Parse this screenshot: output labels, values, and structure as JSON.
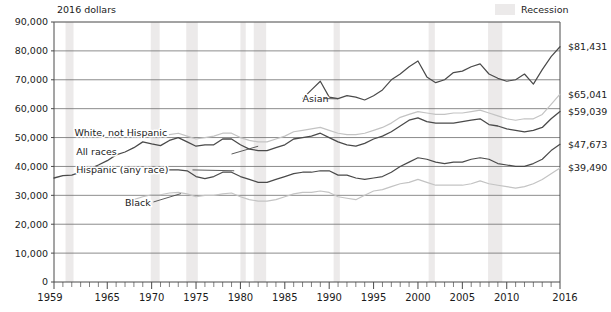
{
  "legend": {
    "recession_label": "Recession",
    "recession_color": "#eceaea"
  },
  "units_note": "2016 dollars",
  "chart_data": {
    "type": "line",
    "title": "",
    "subtitle": "",
    "xlabel": "",
    "ylabel": "2016 dollars",
    "xlim": [
      1959,
      2016
    ],
    "ylim": [
      0,
      90000
    ],
    "grid": true,
    "legend_position": "inline-labels",
    "yticks": [
      "0",
      "10,000",
      "20,000",
      "30,000",
      "40,000",
      "50,000",
      "60,000",
      "70,000",
      "80,000",
      "90,000"
    ],
    "ytick_values": [
      0,
      10000,
      20000,
      30000,
      40000,
      50000,
      60000,
      70000,
      80000,
      90000
    ],
    "xticks": [
      "1959",
      "1965",
      "1970",
      "1975",
      "1980",
      "1985",
      "1990",
      "1995",
      "2000",
      "2005",
      "2010",
      "2016"
    ],
    "xtick_values": [
      1959,
      1965,
      1970,
      1975,
      1980,
      1985,
      1990,
      1995,
      2000,
      2005,
      2010,
      2016
    ],
    "recessions": [
      {
        "start": 1960.3,
        "end": 1961.2
      },
      {
        "start": 1969.9,
        "end": 1970.9
      },
      {
        "start": 1973.9,
        "end": 1975.2
      },
      {
        "start": 1980.0,
        "end": 1980.6
      },
      {
        "start": 1981.5,
        "end": 1982.9
      },
      {
        "start": 1990.5,
        "end": 1991.2
      },
      {
        "start": 2001.2,
        "end": 2001.9
      },
      {
        "start": 2007.9,
        "end": 2009.5
      }
    ],
    "series": [
      {
        "name": "Asian",
        "color": "#4a4a4a",
        "width": 1.2,
        "end_label": "$81,431",
        "end_value": 81431,
        "label_x": 1987.0,
        "label_y": 63500,
        "x": [
          1987,
          1988,
          1989,
          1990,
          1991,
          1992,
          1993,
          1994,
          1995,
          1996,
          1997,
          1998,
          1999,
          2000,
          2001,
          2002,
          2003,
          2004,
          2005,
          2006,
          2007,
          2008,
          2009,
          2010,
          2011,
          2012,
          2013,
          2014,
          2015,
          2016
        ],
        "values": [
          63500,
          66500,
          69500,
          64000,
          63500,
          64500,
          64000,
          63000,
          64500,
          66500,
          70000,
          72000,
          74500,
          76500,
          71000,
          69000,
          70000,
          72500,
          73000,
          74500,
          75500,
          72000,
          70500,
          69500,
          70000,
          72000,
          68500,
          73500,
          78000,
          81431
        ]
      },
      {
        "name": "White, not Hispanic",
        "color": "#c3c3c3",
        "width": 1.2,
        "end_label": "$65,041",
        "end_value": 65041,
        "label_x": 1961.3,
        "label_y": 51500,
        "x": [
          1972,
          1973,
          1974,
          1975,
          1976,
          1977,
          1978,
          1979,
          1980,
          1981,
          1982,
          1983,
          1984,
          1985,
          1986,
          1987,
          1988,
          1989,
          1990,
          1991,
          1992,
          1993,
          1994,
          1995,
          1996,
          1997,
          1998,
          1999,
          2000,
          2001,
          2002,
          2003,
          2004,
          2005,
          2006,
          2007,
          2008,
          2009,
          2010,
          2011,
          2012,
          2013,
          2014,
          2015,
          2016
        ],
        "values": [
          51000,
          51500,
          50500,
          49500,
          50000,
          50500,
          51500,
          51500,
          50000,
          49000,
          48500,
          48500,
          49500,
          50500,
          52000,
          52500,
          53000,
          53500,
          52500,
          51500,
          51000,
          51000,
          51500,
          52500,
          53500,
          55000,
          57000,
          58000,
          59000,
          58500,
          58000,
          58000,
          58500,
          58500,
          59000,
          59500,
          58500,
          57500,
          56500,
          56000,
          56500,
          56500,
          58000,
          61500,
          65041
        ]
      },
      {
        "name": "All races",
        "color": "#4a4a4a",
        "width": 1.3,
        "end_label": "$59,039",
        "end_value": 59039,
        "label_x": 1961.5,
        "label_y": 45000,
        "x": [
          1959,
          1960,
          1961,
          1962,
          1963,
          1964,
          1965,
          1966,
          1967,
          1968,
          1969,
          1970,
          1971,
          1972,
          1973,
          1974,
          1975,
          1976,
          1977,
          1978,
          1979,
          1980,
          1981,
          1982,
          1983,
          1984,
          1985,
          1986,
          1987,
          1988,
          1989,
          1990,
          1991,
          1992,
          1993,
          1994,
          1995,
          1996,
          1997,
          1998,
          1999,
          2000,
          2001,
          2002,
          2003,
          2004,
          2005,
          2006,
          2007,
          2008,
          2009,
          2010,
          2011,
          2012,
          2013,
          2014,
          2015,
          2016
        ],
        "values": [
          36000,
          36800,
          37000,
          38000,
          39200,
          40500,
          42000,
          44000,
          45000,
          46500,
          48500,
          47800,
          47200,
          49000,
          50000,
          48500,
          47000,
          47500,
          47500,
          49500,
          49500,
          47500,
          46000,
          45500,
          45500,
          46500,
          47500,
          49500,
          50000,
          50500,
          51500,
          50000,
          48500,
          47500,
          47000,
          48000,
          49500,
          50500,
          52000,
          54000,
          56000,
          56800,
          55500,
          55000,
          55000,
          55000,
          55500,
          56000,
          56500,
          54500,
          54000,
          53000,
          52500,
          52000,
          52500,
          53500,
          56500,
          59039
        ]
      },
      {
        "name": "Hispanic (any race)",
        "color": "#4a4a4a",
        "width": 1.2,
        "end_label": "$47,673",
        "end_value": 47673,
        "label_x": 1961.5,
        "label_y": 38800,
        "x": [
          1972,
          1973,
          1974,
          1975,
          1976,
          1977,
          1978,
          1979,
          1980,
          1981,
          1982,
          1983,
          1984,
          1985,
          1986,
          1987,
          1988,
          1989,
          1990,
          1991,
          1992,
          1993,
          1994,
          1995,
          1996,
          1997,
          1998,
          1999,
          2000,
          2001,
          2002,
          2003,
          2004,
          2005,
          2006,
          2007,
          2008,
          2009,
          2010,
          2011,
          2012,
          2013,
          2014,
          2015,
          2016
        ],
        "values": [
          38800,
          38800,
          38500,
          36500,
          35800,
          36500,
          38000,
          38000,
          36500,
          35500,
          34500,
          34500,
          35500,
          36500,
          37500,
          38000,
          38000,
          38500,
          38500,
          37000,
          37000,
          36000,
          35500,
          36000,
          36500,
          38000,
          40000,
          41500,
          43000,
          42500,
          41500,
          41000,
          41500,
          41500,
          42500,
          43000,
          42500,
          41000,
          40500,
          40000,
          40000,
          41000,
          42500,
          45500,
          47673
        ]
      },
      {
        "name": "Black",
        "color": "#c3c3c3",
        "width": 1.2,
        "end_label": "$39,490",
        "end_value": 39490,
        "label_x": 1967.0,
        "label_y": 27500,
        "x": [
          1967,
          1968,
          1969,
          1970,
          1971,
          1972,
          1973,
          1974,
          1975,
          1976,
          1977,
          1978,
          1979,
          1980,
          1981,
          1982,
          1983,
          1984,
          1985,
          1986,
          1987,
          1988,
          1989,
          1990,
          1991,
          1992,
          1993,
          1994,
          1995,
          1996,
          1997,
          1998,
          1999,
          2000,
          2001,
          2002,
          2003,
          2004,
          2005,
          2006,
          2007,
          2008,
          2009,
          2010,
          2011,
          2012,
          2013,
          2014,
          2015,
          2016
        ],
        "values": [
          27500,
          28500,
          29500,
          30200,
          30200,
          30800,
          31000,
          30500,
          29500,
          30000,
          30000,
          30500,
          30800,
          29500,
          28500,
          28000,
          28000,
          28500,
          29500,
          30500,
          31000,
          31000,
          31500,
          31000,
          29500,
          29000,
          28500,
          30000,
          31500,
          32000,
          33000,
          34000,
          34500,
          35500,
          34500,
          33500,
          33500,
          33500,
          33500,
          34000,
          35000,
          34000,
          33500,
          33000,
          32500,
          33000,
          34000,
          35500,
          37500,
          39490
        ]
      }
    ]
  }
}
